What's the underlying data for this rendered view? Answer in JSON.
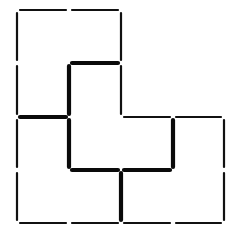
{
  "diagram": {
    "colors": {
      "background": "#ffffff",
      "line": "#111111",
      "thick_line": "#0a0a0a"
    },
    "grid": {
      "x": [
        17,
        69,
        121,
        173,
        224
      ],
      "y": [
        10,
        63,
        117,
        170,
        223
      ]
    },
    "gap": 3,
    "thin_segments": [
      [
        0,
        0,
        1,
        0
      ],
      [
        1,
        0,
        2,
        0
      ],
      [
        0,
        0,
        0,
        1
      ],
      [
        0,
        1,
        0,
        2
      ],
      [
        0,
        2,
        0,
        3
      ],
      [
        0,
        3,
        0,
        4
      ],
      [
        0,
        4,
        1,
        4
      ],
      [
        1,
        4,
        2,
        4
      ],
      [
        2,
        4,
        3,
        4
      ],
      [
        3,
        4,
        4,
        4
      ],
      [
        2,
        0,
        2,
        1
      ],
      [
        2,
        1,
        2,
        2
      ],
      [
        2,
        2,
        3,
        2
      ],
      [
        3,
        2,
        4,
        2
      ],
      [
        4,
        2,
        4,
        3
      ],
      [
        4,
        3,
        4,
        4
      ]
    ],
    "thick_segments": [
      [
        1,
        1,
        2,
        1
      ],
      [
        1,
        1,
        1,
        2
      ],
      [
        1,
        2,
        1,
        3
      ],
      [
        0,
        2,
        1,
        2
      ],
      [
        1,
        3,
        2,
        3
      ],
      [
        2,
        3,
        3,
        3
      ],
      [
        3,
        2,
        3,
        3
      ],
      [
        2,
        3,
        2,
        4
      ]
    ]
  }
}
